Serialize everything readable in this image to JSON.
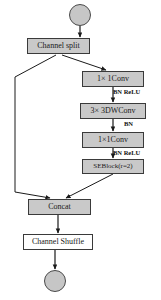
{
  "figure": {
    "type": "flowchart-diagram",
    "background_color": "#ffffff",
    "node_fill_color": "#c9c9c9",
    "node_border_color": "#3a3a3a",
    "edge_color": "#1a1a1a"
  },
  "nodes": {
    "input_node": {
      "label": "",
      "shape": "circle",
      "x": 69,
      "y": 4,
      "d": 22
    },
    "channel_split": {
      "label": "Channel split",
      "shape": "box",
      "x": 27,
      "y": 38,
      "w": 63,
      "h": 16
    },
    "conv1": {
      "label": "1× 1Conv",
      "shape": "box",
      "x": 82,
      "y": 71,
      "w": 62,
      "h": 16
    },
    "dwconv": {
      "label": "3× 3DWConv",
      "shape": "box",
      "x": 80,
      "y": 103,
      "w": 66,
      "h": 16
    },
    "conv2": {
      "label": "1×1Conv",
      "shape": "box",
      "x": 82,
      "y": 132,
      "w": 62,
      "h": 16
    },
    "seblock": {
      "label": "SEBlock(r=2)",
      "shape": "box",
      "x": 82,
      "y": 159,
      "w": 62,
      "h": 15
    },
    "concat": {
      "label": "Concat",
      "shape": "box",
      "x": 28,
      "y": 199,
      "w": 63,
      "h": 16
    },
    "channel_shuffle": {
      "label": "Channel Shuffle",
      "shape": "box",
      "x": 23,
      "y": 234,
      "w": 70,
      "h": 16
    },
    "output_node": {
      "label": "",
      "shape": "circle",
      "x": 44,
      "y": 270,
      "d": 22
    }
  },
  "edge_labels": {
    "bn_relu_1": {
      "text": "BN ReLU",
      "x": 110,
      "y": 90
    },
    "bn_1": {
      "text": "BN",
      "x": 122,
      "y": 122
    },
    "bn_relu_2": {
      "text": "BN ReLU",
      "x": 110,
      "y": 150
    },
    "bn_relu_3": {
      "text": "BN ReLU",
      "x": 110,
      "y": 150
    }
  },
  "edges": [
    {
      "from": "input_node",
      "to": "channel_split",
      "style": "arrow-straight"
    },
    {
      "from": "channel_split",
      "to": "conv1",
      "style": "arrow-diagonal-right"
    },
    {
      "from": "channel_split",
      "to": "concat",
      "style": "polyline-skip-left"
    },
    {
      "from": "conv1",
      "to": "dwconv",
      "style": "arrow-straight",
      "label": "BN ReLU"
    },
    {
      "from": "dwconv",
      "to": "conv2",
      "style": "arrow-straight",
      "label": "BN"
    },
    {
      "from": "conv2",
      "to": "seblock",
      "style": "arrow-straight",
      "label": "BN ReLU"
    },
    {
      "from": "seblock",
      "to": "concat",
      "style": "arrow-diagonal-left"
    },
    {
      "from": "concat",
      "to": "channel_shuffle",
      "style": "arrow-straight"
    },
    {
      "from": "channel_shuffle",
      "to": "output_node",
      "style": "arrow-straight"
    }
  ],
  "caption": {
    "text": "",
    "visible": false
  }
}
